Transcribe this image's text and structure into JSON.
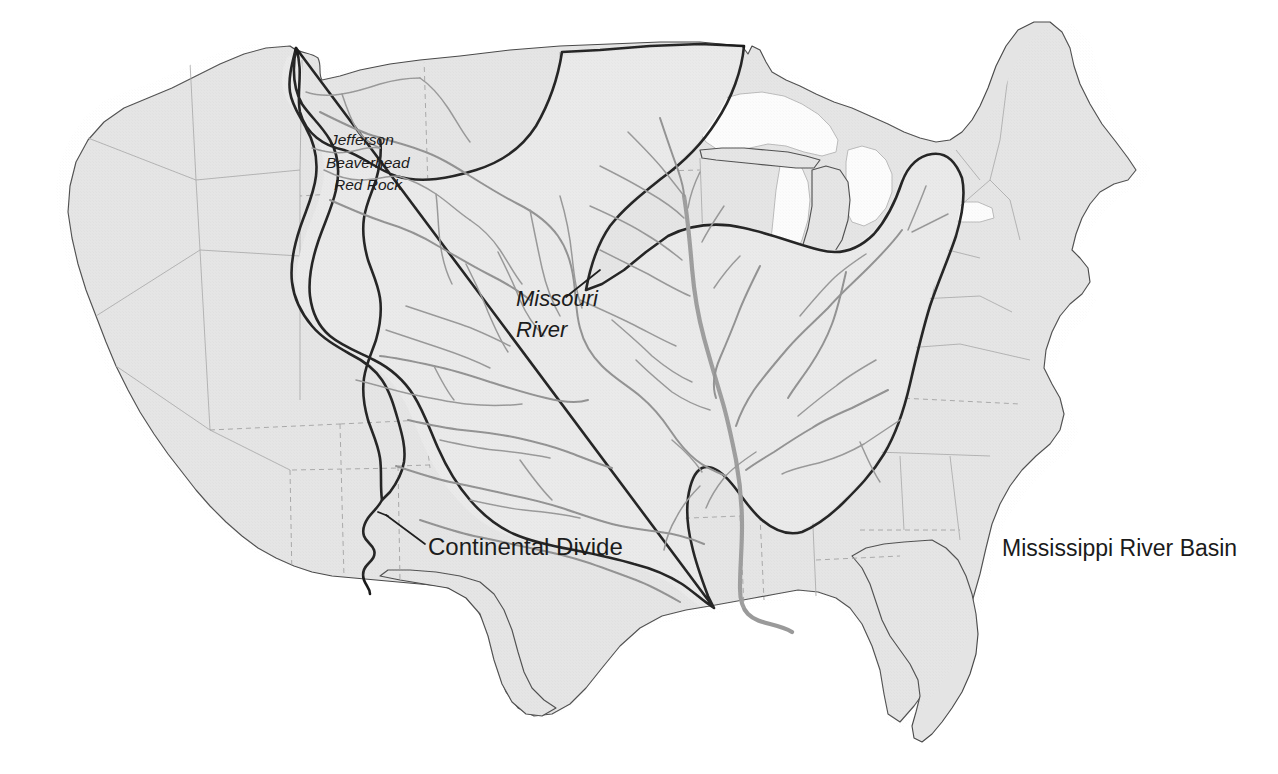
{
  "document": {
    "kind": "reference-map",
    "title": "Mississippi River Basin",
    "background_color": "#ffffff",
    "land_fill": "#e4e4e4",
    "basin_fill": "#e9e9e9",
    "lake_fill": "#fcfcfc",
    "coast_stroke": "#4a4a4a",
    "basin_stroke": "#1c1c1c",
    "river_stroke": "#8e8e8e",
    "state_stroke": "#a6a6a6"
  },
  "labels": {
    "headwaters": {
      "line1": "Jefferson",
      "line2": "Beaverhead",
      "line3": "Red Rock"
    },
    "missouri_river": {
      "line1": "Missouri",
      "line2": "River"
    },
    "continental_divide": "Continental Divide",
    "basin_title": "Mississippi River Basin"
  },
  "map_content": {
    "region": "Conterminous United States",
    "highlighted_watershed": "Mississippi River Basin",
    "boundary_feature": "Continental Divide",
    "named_rivers": [
      "Missouri River",
      "Jefferson",
      "Beaverhead",
      "Red Rock"
    ],
    "water_bodies": [
      "Lake Superior",
      "Lake Michigan",
      "Lake Huron",
      "Lake Erie",
      "Lake Ontario"
    ],
    "legend_note": "Shaded dark-outlined area denotes the Mississippi River drainage basin; the Continental Divide forms its western limit."
  }
}
